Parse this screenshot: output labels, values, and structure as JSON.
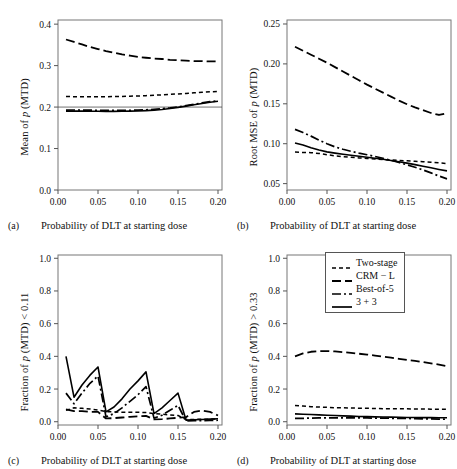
{
  "figure": {
    "panels": [
      {
        "tag": "(a)",
        "ylabel_pre": "Mean of ",
        "ylabel_ital": "p",
        "ylabel_post": " (MTD)",
        "xlabel": "Probability of DLT at starting dose"
      },
      {
        "tag": "(b)",
        "ylabel_pre": "Root MSE of ",
        "ylabel_ital": "p",
        "ylabel_post": " (MTD)",
        "xlabel": "Probability of DLT at starting dose"
      },
      {
        "tag": "(c)",
        "ylabel_pre": "Fraction of ",
        "ylabel_ital": "p",
        "ylabel_post": " (MTD) < 0.11",
        "xlabel": "Probability of DLT at starting dose"
      },
      {
        "tag": "(d)",
        "ylabel_pre": "Fraction of ",
        "ylabel_ital": "p",
        "ylabel_post": " (MTD) > 0.33",
        "xlabel": "Probability of DLT at starting dose"
      }
    ],
    "legend": {
      "position": "panel-d-top-right",
      "entries": [
        {
          "label": "Two-stage",
          "dash": "4,3",
          "width": 1.6
        },
        {
          "label": "CRM − L",
          "dash": "9,4",
          "width": 1.8
        },
        {
          "label": "Best-of-5",
          "dash": "9,3,2,3",
          "width": 1.7
        },
        {
          "label": "3 + 3",
          "dash": "none",
          "width": 1.7
        }
      ]
    }
  },
  "chart_data": [
    {
      "type": "line",
      "panel": "a",
      "title": "",
      "xlabel": "Probability of DLT at starting dose",
      "ylabel": "Mean of p (MTD)",
      "xlim": [
        0.0,
        0.205
      ],
      "ylim": [
        0.0,
        0.41
      ],
      "xticks": [
        "0.00",
        "0.05",
        "0.10",
        "0.15",
        "0.20"
      ],
      "xtickvals": [
        0.0,
        0.05,
        0.1,
        0.15,
        0.2
      ],
      "yticks": [
        "0.0",
        "0.1",
        "0.2",
        "0.3",
        "0.4"
      ],
      "ytickvals": [
        0.0,
        0.1,
        0.2,
        0.3,
        0.4
      ],
      "grid": false,
      "reference_lines": [
        {
          "y": 0.2,
          "style": "solid-thin"
        }
      ],
      "x": [
        0.01,
        0.02,
        0.03,
        0.04,
        0.05,
        0.06,
        0.07,
        0.08,
        0.09,
        0.1,
        0.11,
        0.12,
        0.13,
        0.14,
        0.15,
        0.16,
        0.17,
        0.18,
        0.19,
        0.2
      ],
      "series": [
        {
          "name": "CRM − L",
          "values": [
            0.363,
            0.357,
            0.351,
            0.345,
            0.34,
            0.335,
            0.331,
            0.327,
            0.324,
            0.321,
            0.319,
            0.317,
            0.316,
            0.314,
            0.313,
            0.312,
            0.311,
            0.311,
            0.31,
            0.31
          ]
        },
        {
          "name": "Two-stage",
          "values": [
            0.2255,
            0.225,
            0.2248,
            0.2247,
            0.2248,
            0.225,
            0.2253,
            0.2257,
            0.2262,
            0.2268,
            0.2276,
            0.2285,
            0.2295,
            0.2306,
            0.2318,
            0.233,
            0.2344,
            0.2356,
            0.2368,
            0.2378
          ]
        },
        {
          "name": "Best-of-5",
          "values": [
            0.1925,
            0.193,
            0.1928,
            0.1925,
            0.1923,
            0.1921,
            0.192,
            0.1921,
            0.1923,
            0.1927,
            0.1934,
            0.1945,
            0.196,
            0.198,
            0.2005,
            0.2035,
            0.2068,
            0.21,
            0.213,
            0.215
          ]
        },
        {
          "name": "3 + 3",
          "values": [
            0.19,
            0.1905,
            0.1903,
            0.19,
            0.1898,
            0.1897,
            0.1897,
            0.1899,
            0.1902,
            0.1907,
            0.1915,
            0.1927,
            0.1943,
            0.1965,
            0.1992,
            0.2022,
            0.2055,
            0.2088,
            0.2118,
            0.214
          ]
        }
      ]
    },
    {
      "type": "line",
      "panel": "b",
      "title": "",
      "xlabel": "Probability of DLT at starting dose",
      "ylabel": "Root MSE of p (MTD)",
      "xlim": [
        0.0,
        0.205
      ],
      "ylim": [
        0.042,
        0.255
      ],
      "xticks": [
        "0.00",
        "0.05",
        "0.10",
        "0.15",
        "0.20"
      ],
      "xtickvals": [
        0.0,
        0.05,
        0.1,
        0.15,
        0.2
      ],
      "yticks": [
        "0.05",
        "0.10",
        "0.15",
        "0.20",
        "0.25"
      ],
      "ytickvals": [
        0.05,
        0.1,
        0.15,
        0.2,
        0.25
      ],
      "grid": false,
      "x": [
        0.01,
        0.02,
        0.03,
        0.04,
        0.05,
        0.06,
        0.07,
        0.08,
        0.09,
        0.1,
        0.11,
        0.12,
        0.13,
        0.14,
        0.15,
        0.16,
        0.17,
        0.18,
        0.19,
        0.2
      ],
      "series": [
        {
          "name": "CRM − L",
          "values": [
            0.2215,
            0.2165,
            0.2115,
            0.2065,
            0.2015,
            0.196,
            0.1905,
            0.185,
            0.1795,
            0.174,
            0.169,
            0.164,
            0.159,
            0.154,
            0.1495,
            0.1455,
            0.142,
            0.1385,
            0.136,
            0.138
          ]
        },
        {
          "name": "Best-of-5",
          "values": [
            0.118,
            0.114,
            0.1095,
            0.1045,
            0.1,
            0.096,
            0.093,
            0.0905,
            0.0882,
            0.0862,
            0.084,
            0.0818,
            0.0792,
            0.0765,
            0.0735,
            0.0705,
            0.0672,
            0.0635,
            0.0595,
            0.056
          ]
        },
        {
          "name": "3 + 3",
          "values": [
            0.101,
            0.0985,
            0.095,
            0.092,
            0.0898,
            0.0882,
            0.0868,
            0.0855,
            0.0842,
            0.083,
            0.0818,
            0.0805,
            0.079,
            0.0775,
            0.0757,
            0.0738,
            0.0718,
            0.0698,
            0.0678,
            0.066
          ]
        },
        {
          "name": "Two-stage",
          "values": [
            0.0895,
            0.089,
            0.0888,
            0.0878,
            0.0862,
            0.0848,
            0.0838,
            0.083,
            0.0822,
            0.0815,
            0.0808,
            0.0802,
            0.0796,
            0.079,
            0.0785,
            0.078,
            0.0775,
            0.0768,
            0.076,
            0.0752
          ]
        }
      ]
    },
    {
      "type": "line",
      "panel": "c",
      "title": "",
      "xlabel": "Probability of DLT at starting dose",
      "ylabel": "Fraction of p (MTD) < 0.11",
      "xlim": [
        0.0,
        0.205
      ],
      "ylim": [
        -0.02,
        1.02
      ],
      "xticks": [
        "0.00",
        "0.05",
        "0.10",
        "0.15",
        "0.20"
      ],
      "xtickvals": [
        0.0,
        0.05,
        0.1,
        0.15,
        0.2
      ],
      "yticks": [
        "0.0",
        "0.2",
        "0.4",
        "0.6",
        "0.8",
        "1.0"
      ],
      "ytickvals": [
        0.0,
        0.2,
        0.4,
        0.6,
        0.8,
        1.0
      ],
      "grid": false,
      "x": [
        0.01,
        0.02,
        0.03,
        0.04,
        0.05,
        0.06,
        0.07,
        0.08,
        0.09,
        0.1,
        0.11,
        0.12,
        0.13,
        0.14,
        0.15,
        0.16,
        0.17,
        0.18,
        0.19,
        0.2
      ],
      "series": [
        {
          "name": "3 + 3",
          "values": [
            0.4,
            0.15,
            0.225,
            0.285,
            0.335,
            0.06,
            0.09,
            0.14,
            0.2,
            0.25,
            0.305,
            0.05,
            0.085,
            0.13,
            0.175,
            0.01,
            0.012,
            0.014,
            0.016,
            0.018
          ]
        },
        {
          "name": "Best-of-5",
          "values": [
            0.175,
            0.11,
            0.175,
            0.235,
            0.28,
            0.03,
            0.05,
            0.085,
            0.125,
            0.165,
            0.215,
            0.022,
            0.04,
            0.07,
            0.1,
            0.005,
            0.006,
            0.007,
            0.008,
            0.009
          ]
        },
        {
          "name": "CRM − L",
          "values": [
            0.075,
            0.065,
            0.065,
            0.06,
            0.06,
            0.02,
            0.022,
            0.026,
            0.03,
            0.033,
            0.036,
            0.014,
            0.016,
            0.02,
            0.024,
            0.028,
            0.06,
            0.068,
            0.06,
            0.038
          ]
        },
        {
          "name": "Two-stage",
          "values": [
            0.07,
            0.085,
            0.082,
            0.078,
            0.072,
            0.062,
            0.06,
            0.058,
            0.058,
            0.058,
            0.056,
            0.05,
            0.046,
            0.042,
            0.038,
            0.014,
            0.014,
            0.015,
            0.016,
            0.016
          ]
        }
      ]
    },
    {
      "type": "line",
      "panel": "d",
      "title": "",
      "xlabel": "Probability of DLT at starting dose",
      "ylabel": "Fraction of p (MTD) > 0.33",
      "xlim": [
        0.0,
        0.205
      ],
      "ylim": [
        -0.02,
        1.02
      ],
      "xticks": [
        "0.00",
        "0.05",
        "0.10",
        "0.15",
        "0.20"
      ],
      "xtickvals": [
        0.0,
        0.05,
        0.1,
        0.15,
        0.2
      ],
      "yticks": [
        "0.0",
        "0.2",
        "0.4",
        "0.6",
        "0.8",
        "1.0"
      ],
      "ytickvals": [
        0.0,
        0.2,
        0.4,
        0.6,
        0.8,
        1.0
      ],
      "grid": false,
      "x": [
        0.01,
        0.02,
        0.03,
        0.04,
        0.05,
        0.06,
        0.07,
        0.08,
        0.09,
        0.1,
        0.11,
        0.12,
        0.13,
        0.14,
        0.15,
        0.16,
        0.17,
        0.18,
        0.19,
        0.2
      ],
      "series": [
        {
          "name": "CRM − L",
          "values": [
            0.4,
            0.418,
            0.428,
            0.432,
            0.432,
            0.43,
            0.426,
            0.421,
            0.416,
            0.411,
            0.405,
            0.398,
            0.392,
            0.385,
            0.378,
            0.372,
            0.365,
            0.357,
            0.35,
            0.34
          ]
        },
        {
          "name": "Two-stage",
          "values": [
            0.1,
            0.096,
            0.092,
            0.09,
            0.088,
            0.086,
            0.085,
            0.084,
            0.083,
            0.082,
            0.081,
            0.08,
            0.08,
            0.079,
            0.079,
            0.078,
            0.078,
            0.077,
            0.077,
            0.076
          ]
        },
        {
          "name": "3 + 3",
          "values": [
            0.048,
            0.046,
            0.044,
            0.042,
            0.04,
            0.038,
            0.036,
            0.034,
            0.032,
            0.031,
            0.03,
            0.029,
            0.028,
            0.027,
            0.026,
            0.026,
            0.025,
            0.025,
            0.024,
            0.024
          ]
        },
        {
          "name": "Best-of-5",
          "values": [
            0.02,
            0.021,
            0.022,
            0.023,
            0.024,
            0.024,
            0.024,
            0.024,
            0.023,
            0.023,
            0.022,
            0.022,
            0.021,
            0.02,
            0.02,
            0.019,
            0.018,
            0.017,
            0.016,
            0.015
          ]
        }
      ]
    }
  ]
}
